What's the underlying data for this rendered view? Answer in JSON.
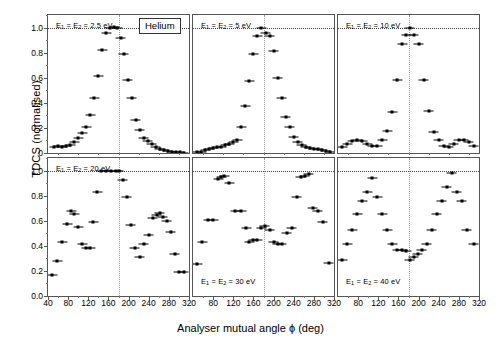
{
  "figure": {
    "species_label": "Helium",
    "ylabel": "TDCS (normalised)",
    "xlabel": "Analyser mutual angle ϕ (deg)"
  },
  "axes": {
    "x_ticks": [
      "40",
      "80",
      "120",
      "160",
      "200",
      "240",
      "280",
      "320"
    ],
    "x_tick_values": [
      40,
      80,
      120,
      160,
      200,
      240,
      280,
      320
    ],
    "y_ticks_top": [
      "0",
      "0.2",
      "0.4",
      "0.6",
      "0.8",
      "1.0"
    ],
    "y_ticks_bottom": [
      "0.0",
      "0.2",
      "0.4",
      "0.6",
      "0.8",
      "1.0"
    ],
    "y_tick_values": [
      0,
      0.2,
      0.4,
      0.6,
      0.8,
      1.0
    ],
    "xlim": [
      40,
      320
    ],
    "ylim": [
      0,
      1.1
    ],
    "reference_hline": 1.0,
    "reference_vline": 180
  },
  "chart_data": {
    "type": "scatter",
    "title": "Helium",
    "xlabel": "Analyser mutual angle ϕ (deg)",
    "ylabel": "TDCS (normalised)",
    "xlim": [
      40,
      320
    ],
    "ylim": [
      0,
      1.1
    ],
    "grid": false,
    "legend": "none",
    "panel_layout": [
      2,
      3
    ],
    "annotations": [
      "Helium label boxed in top-left panel",
      "dotted horizontal line at TDCS = 1.0",
      "dotted vertical line at phi = 180 deg"
    ],
    "panels": [
      {
        "id": "p25",
        "label": "E₁ = E₂ = 2.5 eV",
        "energy_eV": 2.5,
        "row": 0,
        "col": 0,
        "x": [
          52,
          60,
          68,
          76,
          84,
          92,
          100,
          108,
          116,
          124,
          132,
          140,
          148,
          156,
          164,
          172,
          178,
          184,
          190,
          198,
          206,
          214,
          222,
          230,
          238,
          246,
          254,
          262,
          270,
          278,
          286,
          294,
          302,
          310
        ],
        "y": [
          0.045,
          0.055,
          0.05,
          0.055,
          0.06,
          0.09,
          0.12,
          0.16,
          0.21,
          0.3,
          0.44,
          0.61,
          0.825,
          0.96,
          0.995,
          1.005,
          1.0,
          0.92,
          0.79,
          0.58,
          0.44,
          0.265,
          0.185,
          0.12,
          0.095,
          0.07,
          0.05,
          0.035,
          0.025,
          0.015,
          0.01,
          0.008,
          0.005,
          0.003
        ]
      },
      {
        "id": "p5",
        "label": "E₁ = E₂ = 5 eV",
        "energy_eV": 5,
        "row": 0,
        "col": 1,
        "x": [
          48,
          56,
          64,
          72,
          80,
          88,
          96,
          104,
          112,
          120,
          128,
          136,
          144,
          152,
          160,
          168,
          176,
          184,
          192,
          200,
          208,
          216,
          224,
          232,
          240,
          248,
          256,
          264,
          272,
          280,
          288,
          296,
          304,
          312
        ],
        "y": [
          0.005,
          0.01,
          0.02,
          0.03,
          0.038,
          0.045,
          0.05,
          0.06,
          0.07,
          0.085,
          0.1,
          0.21,
          0.375,
          0.575,
          0.79,
          0.935,
          1.0,
          0.96,
          0.93,
          0.81,
          0.6,
          0.44,
          0.29,
          0.205,
          0.125,
          0.085,
          0.06,
          0.048,
          0.042,
          0.035,
          0.028,
          0.02,
          0.012,
          0.006
        ]
      },
      {
        "id": "p10",
        "label": "E₁ = E₂ = 10 eV",
        "energy_eV": 10,
        "row": 0,
        "col": 2,
        "x": [
          48,
          58,
          68,
          78,
          88,
          98,
          108,
          118,
          128,
          138,
          148,
          158,
          168,
          176,
          182,
          190,
          200,
          210,
          220,
          230,
          240,
          250,
          260,
          270,
          280,
          290,
          300,
          310
        ],
        "y": [
          0.045,
          0.075,
          0.095,
          0.105,
          0.095,
          0.07,
          0.055,
          0.055,
          0.1,
          0.175,
          0.33,
          0.58,
          0.87,
          0.94,
          1.0,
          0.94,
          0.865,
          0.58,
          0.335,
          0.17,
          0.1,
          0.055,
          0.05,
          0.075,
          0.1,
          0.105,
          0.09,
          0.055
        ]
      },
      {
        "id": "p20",
        "label": "E₁ = E₂ = 20 eV",
        "energy_eV": 20,
        "row": 1,
        "col": 0,
        "x": [
          48,
          58,
          68,
          78,
          86,
          92,
          100,
          108,
          116,
          124,
          130,
          138,
          146,
          156,
          166,
          176,
          180,
          188,
          196,
          204,
          212,
          222,
          230,
          240,
          248,
          256,
          262,
          268,
          276,
          284,
          292,
          300,
          310
        ],
        "y": [
          0.17,
          0.28,
          0.43,
          0.57,
          0.68,
          0.65,
          0.55,
          0.415,
          0.38,
          0.38,
          0.59,
          0.83,
          1.0,
          1.0,
          1.0,
          1.0,
          1.0,
          0.925,
          0.79,
          0.565,
          0.38,
          0.31,
          0.415,
          0.485,
          0.625,
          0.645,
          0.66,
          0.63,
          0.6,
          0.51,
          0.335,
          0.195,
          0.195
        ]
      },
      {
        "id": "p30",
        "label": "E₁ = E₂ = 30 eV",
        "energy_eV": 30,
        "row": 1,
        "col": 1,
        "x": [
          48,
          58,
          70,
          80,
          90,
          96,
          102,
          112,
          124,
          136,
          146,
          152,
          160,
          168,
          176,
          182,
          192,
          200,
          208,
          216,
          226,
          236,
          246,
          254,
          262,
          270,
          278,
          288,
          298,
          310
        ],
        "y": [
          0.255,
          0.43,
          0.605,
          0.605,
          0.93,
          0.945,
          0.955,
          0.9,
          0.675,
          0.675,
          0.545,
          0.43,
          0.445,
          0.45,
          0.545,
          0.56,
          0.53,
          0.43,
          0.415,
          0.415,
          0.5,
          0.545,
          0.79,
          0.95,
          0.96,
          0.975,
          0.7,
          0.675,
          0.59,
          0.26
        ]
      },
      {
        "id": "p40",
        "label": "E₁ = E₂ = 40 eV",
        "energy_eV": 40,
        "row": 1,
        "col": 2,
        "x": [
          48,
          58,
          68,
          78,
          88,
          98,
          108,
          118,
          128,
          138,
          148,
          158,
          168,
          176,
          182,
          190,
          198,
          206,
          216,
          226,
          236,
          246,
          256,
          266,
          276,
          286,
          296,
          310
        ],
        "y": [
          0.29,
          0.415,
          0.53,
          0.65,
          0.755,
          0.83,
          0.94,
          0.79,
          0.65,
          0.53,
          0.415,
          0.37,
          0.37,
          0.36,
          0.29,
          0.31,
          0.335,
          0.37,
          0.415,
          0.53,
          0.65,
          0.755,
          0.87,
          0.98,
          0.83,
          0.755,
          0.53,
          0.415
        ]
      }
    ]
  }
}
